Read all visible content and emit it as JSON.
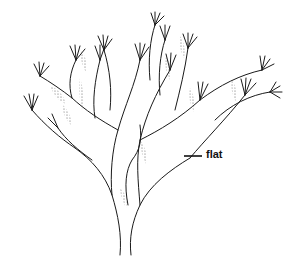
{
  "figure": {
    "annotations": [
      {
        "text": "flat",
        "pointer_x": 186,
        "pointer_y": 155
      }
    ]
  }
}
